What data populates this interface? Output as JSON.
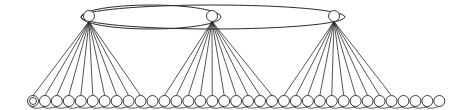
{
  "diagram": {
    "type": "graph",
    "colors": {
      "stroke": "#2b2b2b",
      "fill": "#ffffff",
      "background": "#ffffff"
    },
    "hubs": [
      {
        "id": "hub-1",
        "x": 89,
        "y": 16,
        "r": 5.5
      },
      {
        "id": "hub-2",
        "x": 212,
        "y": 16,
        "r": 5.5
      },
      {
        "id": "hub-3",
        "x": 334,
        "y": 16,
        "r": 5.5
      }
    ],
    "hub_loops": [
      {
        "id": "loop-hub1-hub2",
        "cx": 151,
        "cy": 17,
        "rx": 70,
        "ry": 12
      },
      {
        "id": "loop-hub1-hub3",
        "cx": 213,
        "cy": 17,
        "rx": 132,
        "ry": 12
      }
    ],
    "leaf_row": {
      "y": 101,
      "r": 5.5,
      "x_start": 33,
      "spacing": 11.95,
      "count": 35,
      "double_first": true
    },
    "fans": [
      {
        "hub": 0,
        "leaves": [
          0,
          1,
          2,
          3,
          4,
          5,
          6,
          7,
          8,
          9
        ]
      },
      {
        "hub": 1,
        "leaves": [
          11,
          12,
          13,
          14,
          15,
          16,
          17,
          18,
          19,
          20
        ]
      },
      {
        "hub": 2,
        "leaves": [
          21,
          22,
          23,
          24,
          25,
          26,
          27,
          28,
          29,
          30
        ]
      }
    ]
  }
}
